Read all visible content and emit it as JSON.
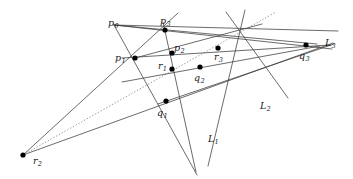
{
  "figure": {
    "stroke_color": "#3a3a3a",
    "dotted_color": "#9a9a9a",
    "point_color": "#000000",
    "background": "#ffffff",
    "width": 353,
    "height": 179,
    "points": [
      {
        "id": "p0",
        "label": "p",
        "sub": "0",
        "x": 131.0,
        "y": 33.0,
        "lx": 108.0,
        "ly": 18.0,
        "dot": false
      },
      {
        "id": "p1",
        "label": "p",
        "sub": "1",
        "x": 135.0,
        "y": 58.0,
        "lx": 115.0,
        "ly": 53.0,
        "dot": true
      },
      {
        "id": "p2",
        "label": "p",
        "sub": "2",
        "x": 172.0,
        "y": 53.0,
        "lx": 174.0,
        "ly": 43.0,
        "dot": true
      },
      {
        "id": "p3",
        "label": "p",
        "sub": "3",
        "x": 165.0,
        "y": 30.0,
        "lx": 160.0,
        "ly": 16.0,
        "dot": true
      },
      {
        "id": "r1",
        "label": "r",
        "sub": "1",
        "x": 172.0,
        "y": 69.0,
        "lx": 158.0,
        "ly": 61.0,
        "dot": true
      },
      {
        "id": "r2",
        "label": "r",
        "sub": "2",
        "x": 23.0,
        "y": 155.0,
        "lx": 33.0,
        "ly": 156.0,
        "dot": true
      },
      {
        "id": "r3",
        "label": "r",
        "sub": "3",
        "x": 218.0,
        "y": 48.0,
        "lx": 214.0,
        "ly": 52.0,
        "dot": true
      },
      {
        "id": "q1",
        "label": "q",
        "sub": "1",
        "x": 166.0,
        "y": 101.0,
        "lx": 157.0,
        "ly": 108.0,
        "dot": true
      },
      {
        "id": "q2",
        "label": "q",
        "sub": "2",
        "x": 200.0,
        "y": 67.0,
        "lx": 194.0,
        "ly": 73.0,
        "dot": true
      },
      {
        "id": "q3",
        "label": "q",
        "sub": "3",
        "x": 306.0,
        "y": 45.0,
        "lx": 299.0,
        "ly": 51.0,
        "dot": true
      }
    ],
    "line_labels": [
      {
        "id": "L1",
        "label": "L",
        "sub": "1",
        "lx": 208.0,
        "ly": 134.0
      },
      {
        "id": "L2",
        "label": "L",
        "sub": "2",
        "lx": 260.0,
        "ly": 101.0
      },
      {
        "id": "L3",
        "label": "L",
        "sub": "3",
        "lx": 325.0,
        "ly": 38.0
      }
    ],
    "segments": [
      {
        "name": "p0-to-q3-upper",
        "x1": 114.0,
        "y1": 25.0,
        "x2": 338.0,
        "y2": 31.0,
        "dotted": false
      },
      {
        "name": "p0-through-p3-to-q3",
        "x1": 114.0,
        "y1": 25.0,
        "x2": 332.0,
        "y2": 49.0,
        "dotted": false
      },
      {
        "name": "p0-through-p2-r3-q3",
        "x1": 114.0,
        "y1": 25.0,
        "x2": 317.0,
        "y2": 44.0,
        "dotted": false
      },
      {
        "name": "p0-through-p1-to-q1-lower",
        "x1": 114.0,
        "y1": 25.0,
        "x2": 197.0,
        "y2": 175.0,
        "dotted": false
      },
      {
        "name": "L1-line-through-q1",
        "x1": 245.0,
        "y1": 10.0,
        "x2": 208.0,
        "y2": 166.0,
        "dotted": false
      },
      {
        "name": "r2-to-p3-ray",
        "x1": 23.0,
        "y1": 155.0,
        "x2": 178.0,
        "y2": 13.0,
        "dotted": false
      },
      {
        "name": "r2-to-q3-line",
        "x1": 23.0,
        "y1": 155.0,
        "x2": 333.0,
        "y2": 43.0,
        "dotted": false
      },
      {
        "name": "r2-dotted-to-topright",
        "x1": 23.0,
        "y1": 155.0,
        "x2": 276.0,
        "y2": 12.0,
        "dotted": true
      },
      {
        "name": "p1-horizontal-to-q3",
        "x1": 122.0,
        "y1": 58.0,
        "x2": 330.0,
        "y2": 45.0,
        "dotted": false
      },
      {
        "name": "left-midline-to-right",
        "x1": 122.0,
        "y1": 82.0,
        "x2": 320.0,
        "y2": 46.0,
        "dotted": false
      },
      {
        "name": "p3-down-through-p2-r1",
        "x1": 163.0,
        "y1": 22.0,
        "x2": 196.0,
        "y2": 172.0,
        "dotted": false
      },
      {
        "name": "L2-diagonal",
        "x1": 226.0,
        "y1": 12.0,
        "x2": 288.0,
        "y2": 98.0,
        "dotted": false
      },
      {
        "name": "p1-to-r3-to-upperright",
        "x1": 135.0,
        "y1": 58.0,
        "x2": 262.0,
        "y2": 24.0,
        "dotted": false
      },
      {
        "name": "q1-to-q3-line",
        "x1": 158.0,
        "y1": 104.0,
        "x2": 334.0,
        "y2": 44.0,
        "dotted": false
      }
    ]
  }
}
